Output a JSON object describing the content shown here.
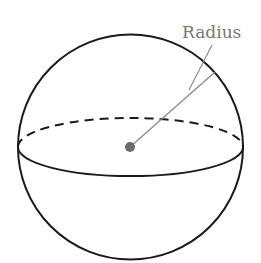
{
  "diagram": {
    "label": "Radius",
    "colors": {
      "outline": "#1a1a1a",
      "radius_line": "#8a8a8a",
      "center_dot": "#6b6b6b",
      "label": "#777777",
      "background": "#ffffff"
    }
  }
}
